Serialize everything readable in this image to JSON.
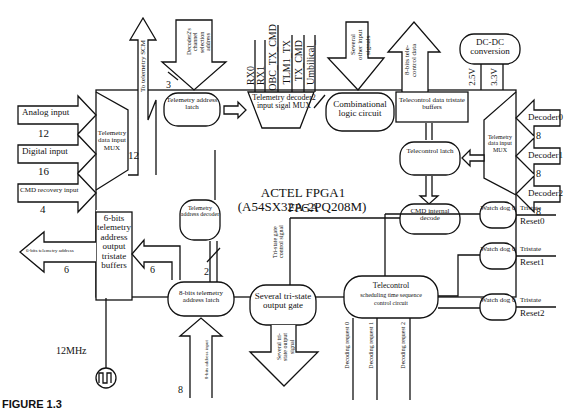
{
  "diagram": {
    "fpga_title": "ACTEL FPGA1",
    "fpga_part": "(A54SX32A-2PQ208M)",
    "fpga_label": "FPGA",
    "clock": "12MHz",
    "caption": "FIGURE 1.3",
    "inputs_left": [
      {
        "label": "Analog input",
        "width": "12"
      },
      {
        "label": "Digital input",
        "width": "16"
      },
      {
        "label": "CMD recovery input",
        "width": "4"
      }
    ],
    "telemetry_mux_left": "Telemetry data input MUX",
    "to_telemetry_scm": "To telemetry SCM",
    "to_scm_width": "12",
    "decoder2_sel": "Decoder2's channel selection address",
    "decoder2_sel_width": "3",
    "telemetry_address_latch": "Telemetry address latch",
    "decoder2_signals": [
      "RX0",
      "RX1",
      "OBC_TX_CMD",
      "TLM1_TX",
      "TX_CMD",
      "Umbilical_"
    ],
    "decoder2_mux": "Telemetry decoder2 input sigal MUX",
    "other_inputs": "Several other input signals",
    "combinational": "Combinational logic circuit",
    "telecontrol_data_out": "8-bits tele-control data",
    "telecontrol_buffers": "Telecontrol data tristate buffers",
    "dcdc": "DC-DC conversion",
    "v25": "2.5V",
    "v33": "3.3V",
    "decoders_right": [
      {
        "label": "Decoder0",
        "width": "8"
      },
      {
        "label": "Decoder1",
        "width": "8"
      },
      {
        "label": "Decoder2",
        "width": "8"
      }
    ],
    "telemetry_mux_right": "Telemetry data input MUX",
    "telecontrol_latch": "Telecontrol latch",
    "cmd_internal": "CMD internal decode",
    "addr6_buffers": "6-bits telemetry address output tristate buffers",
    "addr6_out": "6-bits telemetry address",
    "addr6_width_out": "6",
    "addr6_width_in": "6",
    "tel_addr_decoder": "Telemetry address decoder",
    "decoder_width": "2",
    "addr8_latch": "8-bits telemetry address latch",
    "addr8_input": "8-bits address input",
    "addr8_width": "8",
    "tristate_ctrl": "Tri-state gate control signal",
    "tristate_gate": "Several tri-state output gate",
    "tristate_out": "Several tri-state output signal",
    "tc_sched": [
      "Telecontrol",
      "scheduling time sequence",
      "control circuit"
    ],
    "decoding_requests": [
      "Decoding request 0",
      "Decoding request 1",
      "Decoding request 2"
    ],
    "watchdogs": [
      {
        "label": "Watch dog 0",
        "out_top": "Tristate",
        "out_bottom": "Reset0"
      },
      {
        "label": "Watch dog 0",
        "out_top": "Tristate",
        "out_bottom": "Reset1"
      },
      {
        "label": "Watch dog 0",
        "out_top": "Tristate",
        "out_bottom": "Reset2"
      }
    ]
  }
}
